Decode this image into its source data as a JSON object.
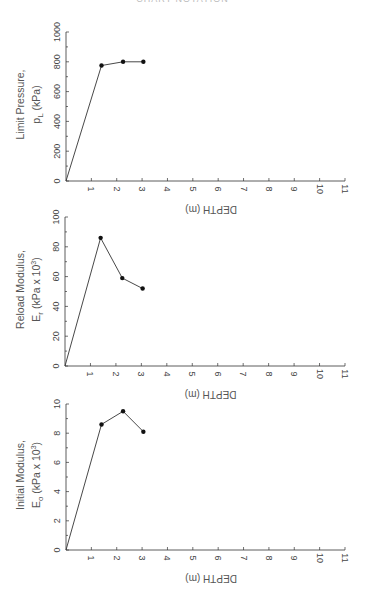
{
  "header": {
    "text": "CHART NOTATION"
  },
  "chart_data": [
    {
      "type": "line",
      "title": "",
      "ylabel_line1": "Limit Pressure,",
      "ylabel_line2": "p_L (kPa)",
      "xlabel": "DEPTH (m)",
      "xlim": [
        0,
        11
      ],
      "ylim": [
        0,
        1000
      ],
      "xticks": [
        1,
        2,
        3,
        4,
        5,
        6,
        7,
        8,
        9,
        10,
        11
      ],
      "yticks": [
        0,
        200,
        400,
        600,
        800,
        1000
      ],
      "yminor_step": 100,
      "series": [
        {
          "name": "Limit Pressure",
          "x": [
            0,
            1.4,
            2.25,
            3.05
          ],
          "y": [
            0,
            775,
            800,
            800
          ],
          "markers": [
            false,
            true,
            true,
            true
          ]
        }
      ]
    },
    {
      "type": "line",
      "title": "",
      "ylabel_line1": "Reload Modulus,",
      "ylabel_line2": "E_r (kPa x 10^3)",
      "xlabel": "DEPTH (m)",
      "xlim": [
        0,
        11
      ],
      "ylim": [
        0,
        100
      ],
      "xticks": [
        1,
        2,
        3,
        4,
        5,
        6,
        7,
        8,
        9,
        10,
        11
      ],
      "yticks": [
        0,
        20,
        40,
        60,
        80,
        100
      ],
      "yminor_step": 10,
      "series": [
        {
          "name": "Reload Modulus",
          "x": [
            0,
            1.4,
            2.25,
            3.05
          ],
          "y": [
            0,
            86,
            59,
            52
          ],
          "markers": [
            false,
            true,
            true,
            true
          ]
        }
      ]
    },
    {
      "type": "line",
      "title": "",
      "ylabel_line1": "Initial Modulus,",
      "ylabel_line2": "E_o (kPa x 10^3)",
      "xlabel": "DEPTH (m)",
      "xlim": [
        0,
        11
      ],
      "ylim": [
        0,
        10
      ],
      "xticks": [
        1,
        2,
        3,
        4,
        5,
        6,
        7,
        8,
        9,
        10,
        11
      ],
      "yticks": [
        0,
        2,
        4,
        6,
        8,
        10
      ],
      "yminor_step": 1,
      "series": [
        {
          "name": "Initial Modulus",
          "x": [
            0,
            1.4,
            2.25,
            3.05
          ],
          "y": [
            0,
            8.6,
            9.5,
            8.1
          ],
          "markers": [
            false,
            true,
            true,
            true
          ]
        }
      ]
    }
  ]
}
